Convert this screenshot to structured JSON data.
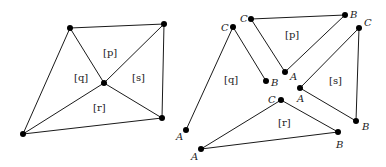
{
  "left_figure": {
    "regions": {
      "p": "[p]",
      "q": "[q]",
      "r": "[r]",
      "s": "[s]"
    }
  },
  "right_figure": {
    "triangles": {
      "q": {
        "label": "[q]",
        "A": "A",
        "B": "B",
        "C": "C"
      },
      "p": {
        "label": "[p]",
        "A": "A",
        "B": "B",
        "C": "C"
      },
      "s": {
        "label": "[s]",
        "A": "A",
        "B": "B",
        "C": "C"
      },
      "r": {
        "label": "[r]",
        "A": "A",
        "B": "B",
        "C": "C"
      }
    }
  },
  "colors": {
    "line": "#1a1a1a",
    "point": "#000000",
    "background": "#ffffff"
  }
}
